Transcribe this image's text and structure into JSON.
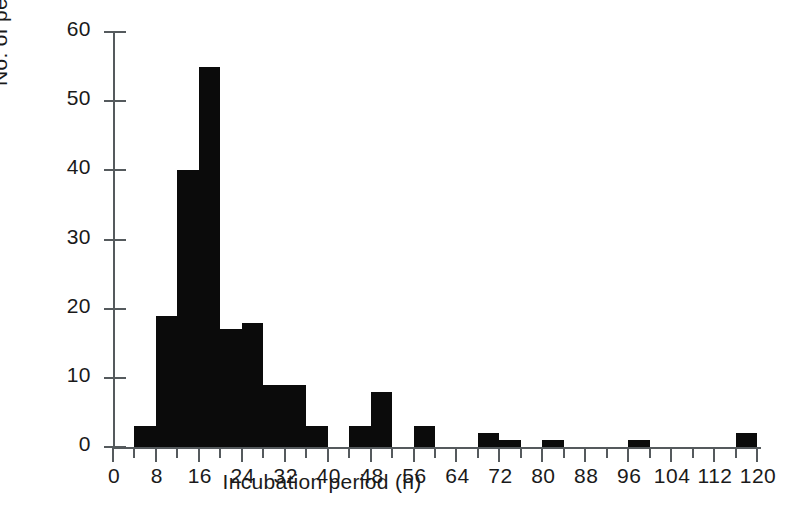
{
  "figure": {
    "background_color": "#ffffff",
    "axis_color": "#555a5d",
    "bar_color": "#0b0b0b",
    "text_color": "#1a1a1a"
  },
  "margin_fragments": {
    "note": "partial letters of adjacent cut-off caption at left edge of scan",
    "lines": [
      "s",
      "x",
      "l",
      "y",
      "g"
    ]
  },
  "chart_data": {
    "type": "bar",
    "title": "",
    "subtitle": "",
    "xlabel": "Incubation period  (h)",
    "ylabel": "No. of people",
    "xlim": [
      0,
      120
    ],
    "ylim": [
      0,
      60
    ],
    "grid": false,
    "legend": null,
    "bin_width": 4,
    "x_major_tick_step": 8,
    "x_minor_tick_step": 4,
    "y_tick_step": 10,
    "xticks": [
      0,
      8,
      16,
      24,
      32,
      40,
      48,
      56,
      64,
      72,
      80,
      88,
      96,
      104,
      112,
      120
    ],
    "xtick_labels": [
      "0",
      "8",
      "16",
      "24",
      "32",
      "40",
      "48",
      "56",
      "64",
      "72",
      "80",
      "88",
      "96",
      "104",
      "112",
      "120"
    ],
    "yticks": [
      0,
      10,
      20,
      30,
      40,
      50,
      60
    ],
    "ytick_labels": [
      "0",
      "10",
      "20",
      "30",
      "40",
      "50",
      "60"
    ],
    "bins": [
      {
        "start": 0,
        "end": 4,
        "value": 0
      },
      {
        "start": 4,
        "end": 8,
        "value": 3
      },
      {
        "start": 8,
        "end": 12,
        "value": 19
      },
      {
        "start": 12,
        "end": 16,
        "value": 40
      },
      {
        "start": 16,
        "end": 20,
        "value": 55
      },
      {
        "start": 20,
        "end": 24,
        "value": 17
      },
      {
        "start": 24,
        "end": 28,
        "value": 18
      },
      {
        "start": 28,
        "end": 32,
        "value": 9
      },
      {
        "start": 32,
        "end": 36,
        "value": 9
      },
      {
        "start": 36,
        "end": 40,
        "value": 3
      },
      {
        "start": 40,
        "end": 44,
        "value": 0
      },
      {
        "start": 44,
        "end": 48,
        "value": 3
      },
      {
        "start": 48,
        "end": 52,
        "value": 8
      },
      {
        "start": 52,
        "end": 56,
        "value": 0
      },
      {
        "start": 56,
        "end": 60,
        "value": 3
      },
      {
        "start": 60,
        "end": 64,
        "value": 0
      },
      {
        "start": 64,
        "end": 68,
        "value": 0
      },
      {
        "start": 68,
        "end": 72,
        "value": 2
      },
      {
        "start": 72,
        "end": 76,
        "value": 1
      },
      {
        "start": 76,
        "end": 80,
        "value": 0
      },
      {
        "start": 80,
        "end": 84,
        "value": 1
      },
      {
        "start": 84,
        "end": 88,
        "value": 0
      },
      {
        "start": 88,
        "end": 92,
        "value": 0
      },
      {
        "start": 92,
        "end": 96,
        "value": 0
      },
      {
        "start": 96,
        "end": 100,
        "value": 1
      },
      {
        "start": 100,
        "end": 104,
        "value": 0
      },
      {
        "start": 104,
        "end": 108,
        "value": 0
      },
      {
        "start": 108,
        "end": 112,
        "value": 0
      },
      {
        "start": 112,
        "end": 116,
        "value": 0
      },
      {
        "start": 116,
        "end": 120,
        "value": 2
      }
    ],
    "categories": [
      "0-4",
      "4-8",
      "8-12",
      "12-16",
      "16-20",
      "20-24",
      "24-28",
      "28-32",
      "32-36",
      "36-40",
      "40-44",
      "44-48",
      "48-52",
      "52-56",
      "56-60",
      "60-64",
      "64-68",
      "68-72",
      "72-76",
      "76-80",
      "80-84",
      "84-88",
      "88-92",
      "92-96",
      "96-100",
      "100-104",
      "104-108",
      "108-112",
      "112-116",
      "116-120"
    ],
    "values": [
      0,
      3,
      19,
      40,
      55,
      17,
      18,
      9,
      9,
      3,
      0,
      3,
      8,
      0,
      3,
      0,
      0,
      2,
      1,
      0,
      1,
      0,
      0,
      0,
      1,
      0,
      0,
      0,
      0,
      2
    ]
  }
}
